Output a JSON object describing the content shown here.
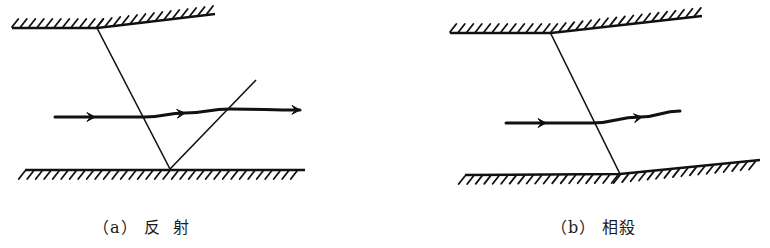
{
  "figure": {
    "panels": [
      {
        "id": "a",
        "caption": "（a） 反  射",
        "description": "reflection",
        "top_wall": [
          [
            12,
            28
          ],
          [
            97,
            28
          ],
          [
            215,
            14
          ]
        ],
        "bottom_wall": [
          [
            25,
            170
          ],
          [
            305,
            170
          ]
        ],
        "lines": [
          [
            [
              97,
              28
            ],
            [
              170,
              169
            ]
          ],
          [
            [
              170,
              169
            ],
            [
              256,
              80
            ]
          ]
        ],
        "flow_path": [
          [
            55,
            117
          ],
          [
            100,
            117
          ],
          [
            145,
            117
          ],
          [
            185,
            113
          ],
          [
            230,
            109
          ],
          [
            300,
            110
          ]
        ],
        "arrowheads": [
          [
            95,
            117
          ],
          [
            185,
            113
          ],
          [
            300,
            110
          ]
        ]
      },
      {
        "id": "b",
        "caption": "（b） 相殺",
        "description": "cancellation",
        "top_wall": [
          [
            450,
            33
          ],
          [
            551,
            33
          ],
          [
            702,
            16
          ]
        ],
        "bottom_wall": [
          [
            465,
            175
          ],
          [
            620,
            174
          ],
          [
            760,
            160
          ]
        ],
        "lines": [
          [
            [
              551,
              34
            ],
            [
              620,
              174
            ]
          ]
        ],
        "flow_path": [
          [
            506,
            123
          ],
          [
            545,
            123
          ],
          [
            592,
            123
          ],
          [
            640,
            117
          ],
          [
            680,
            111
          ]
        ],
        "arrowheads": [
          [
            546,
            123
          ],
          [
            642,
            117
          ]
        ]
      }
    ],
    "colors": {
      "ink": "#111111",
      "background": "#ffffff"
    }
  }
}
